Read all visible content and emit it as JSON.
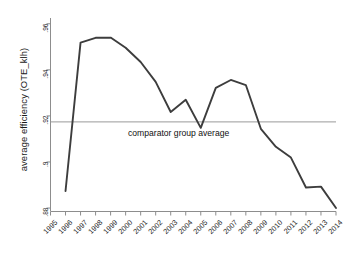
{
  "chart_data": {
    "type": "line",
    "title": "",
    "xlabel": "",
    "ylabel": "average efficiency (OTE_klh)",
    "x": [
      1995,
      1996,
      1997,
      1998,
      1999,
      2000,
      2001,
      2002,
      2003,
      2004,
      2005,
      2006,
      2007,
      2008,
      2009,
      2010,
      2011,
      2012,
      2013,
      2014
    ],
    "xtick_labels": [
      "1995",
      "1996",
      "1997",
      "1998",
      "1999",
      "2000",
      "2001",
      "2002",
      "2003",
      "2004",
      "2005",
      "2006",
      "2007",
      "2008",
      "2009",
      "2010",
      "2011",
      "2012",
      "2013",
      "2014"
    ],
    "ytick_labels": [
      ".96",
      ".94",
      ".92",
      ".9",
      ".88"
    ],
    "ytick_values": [
      0.96,
      0.94,
      0.92,
      0.9,
      0.88
    ],
    "ylim": [
      0.8785,
      0.9625
    ],
    "xlim": [
      1995,
      2014
    ],
    "grid": false,
    "legend": null,
    "series": [
      {
        "name": "average efficiency (OTE_klh)",
        "color": "#3d3d3d",
        "x": [
          1996,
          1997,
          1998,
          1999,
          2000,
          2001,
          2002,
          2003,
          2004,
          2005,
          2006,
          2007,
          2008,
          2009,
          2010,
          2011,
          2012,
          2013,
          2014
        ],
        "values": [
          0.8874,
          0.9518,
          0.9539,
          0.954,
          0.9496,
          0.9434,
          0.9348,
          0.9217,
          0.927,
          0.9148,
          0.9322,
          0.9356,
          0.9334,
          0.9144,
          0.9066,
          0.9019,
          0.8889,
          0.8893,
          0.88
        ]
      }
    ],
    "annotations": [
      {
        "name": "comparator-group-average",
        "type": "hline",
        "value": 0.9174,
        "label": "comparator group average",
        "color": "#9a9a9a"
      }
    ]
  },
  "axis": {
    "line_color": "#8d8d8d",
    "tick_color": "#8d8d8d"
  }
}
